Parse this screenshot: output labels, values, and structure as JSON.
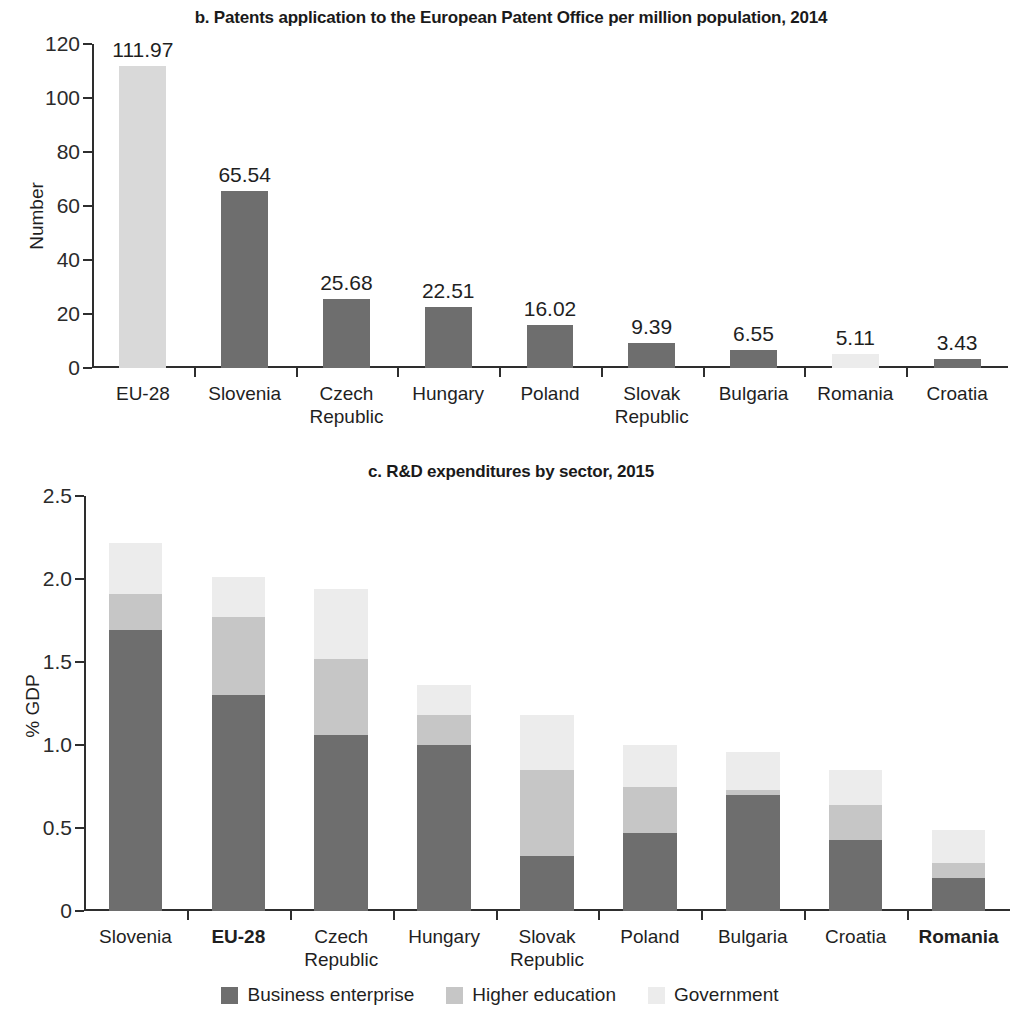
{
  "colors": {
    "business_enterprise": "#6e6e6e",
    "higher_education": "#c6c6c6",
    "government": "#ececec",
    "eu28_bar": "#d9d9d9",
    "default_bar": "#6e6e6e",
    "axis": "#2e2e2e",
    "text": "#1f1f1f"
  },
  "panel_b": {
    "title": "b. Patents application to the European Patent Office per million population, 2014",
    "ylabel": "Number"
  },
  "panel_c": {
    "title": "c. R&D expenditures by sector, 2015",
    "ylabel": "% GDP"
  },
  "legend": {
    "items": [
      {
        "label": "Business enterprise",
        "key": "business_enterprise"
      },
      {
        "label": "Higher education",
        "key": "higher_education"
      },
      {
        "label": "Government",
        "key": "government"
      }
    ]
  },
  "chart_data": [
    {
      "id": "panel_b",
      "type": "bar",
      "title": "b. Patents application to the European Patent Office per million population, 2014",
      "xlabel": "",
      "ylabel": "Number",
      "ylim": [
        0,
        120
      ],
      "yticks": [
        0,
        20,
        40,
        60,
        80,
        100,
        120
      ],
      "ytick_labels": [
        "0",
        "20",
        "40",
        "60",
        "80",
        "100",
        "120"
      ],
      "grid": false,
      "legend": "none",
      "categories": [
        "EU-28",
        "Slovenia",
        "Czech\nRepublic",
        "Hungary",
        "Poland",
        "Slovak\nRepublic",
        "Bulgaria",
        "Romania",
        "Croatia"
      ],
      "values": [
        111.97,
        65.54,
        25.68,
        22.51,
        16.02,
        9.39,
        6.55,
        5.11,
        3.43
      ],
      "data_labels": [
        "111.97",
        "65.54",
        "25.68",
        "22.51",
        "16.02",
        "9.39",
        "6.55",
        "5.11",
        "3.43"
      ],
      "bar_colors": [
        "#d9d9d9",
        "#6e6e6e",
        "#6e6e6e",
        "#6e6e6e",
        "#6e6e6e",
        "#6e6e6e",
        "#6e6e6e",
        "#ececec",
        "#6e6e6e"
      ],
      "bold_categories": []
    },
    {
      "id": "panel_c",
      "type": "bar",
      "subtype": "stacked",
      "title": "c. R&D expenditures by sector, 2015",
      "xlabel": "",
      "ylabel": "% GDP",
      "ylim": [
        0,
        2.5
      ],
      "yticks": [
        0,
        0.5,
        1.0,
        1.5,
        2.0,
        2.5
      ],
      "ytick_labels": [
        "0",
        "0.5",
        "1.0",
        "1.5",
        "2.0",
        "2.5"
      ],
      "grid": false,
      "legend": "bottom",
      "categories": [
        "Slovenia",
        "EU-28",
        "Czech\nRepublic",
        "Hungary",
        "Slovak\nRepublic",
        "Poland",
        "Bulgaria",
        "Croatia",
        "Romania"
      ],
      "bold_categories": [
        "EU-28",
        "Romania"
      ],
      "series": [
        {
          "name": "Business enterprise",
          "color": "#6e6e6e",
          "values": [
            1.69,
            1.3,
            1.06,
            1.0,
            0.33,
            0.47,
            0.7,
            0.43,
            0.2
          ]
        },
        {
          "name": "Higher education",
          "color": "#c6c6c6",
          "values": [
            0.22,
            0.47,
            0.46,
            0.18,
            0.52,
            0.28,
            0.03,
            0.21,
            0.09
          ]
        },
        {
          "name": "Government",
          "color": "#ececec",
          "values": [
            0.31,
            0.24,
            0.42,
            0.18,
            0.33,
            0.25,
            0.23,
            0.21,
            0.2
          ]
        }
      ],
      "totals": [
        2.22,
        2.01,
        1.94,
        1.36,
        1.18,
        1.0,
        0.96,
        0.85,
        0.49
      ]
    }
  ]
}
